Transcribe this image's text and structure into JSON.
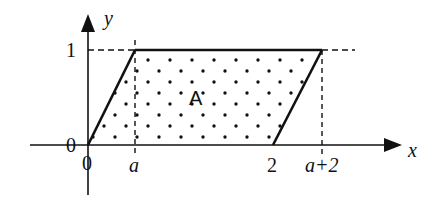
{
  "diagram": {
    "type": "parallelogram-region-on-axes",
    "axes": {
      "x_label": "x",
      "y_label": "y",
      "origin_x_label": "0",
      "origin_y_label": "0"
    },
    "x_ticks": [
      "0",
      "a",
      "2",
      "a+2"
    ],
    "y_ticks": [
      "0",
      "1"
    ],
    "region": {
      "label": "A",
      "fill": "dotted",
      "vertices": [
        "(0,0)",
        "(a,1)",
        "(a+2,1)",
        "(2,0)"
      ]
    },
    "guides": {
      "dashed_vertical_at": [
        "a",
        "a+2"
      ],
      "dashed_horizontal_at": "1"
    },
    "colors": {
      "stroke": "#111111",
      "background": "#ffffff"
    }
  }
}
